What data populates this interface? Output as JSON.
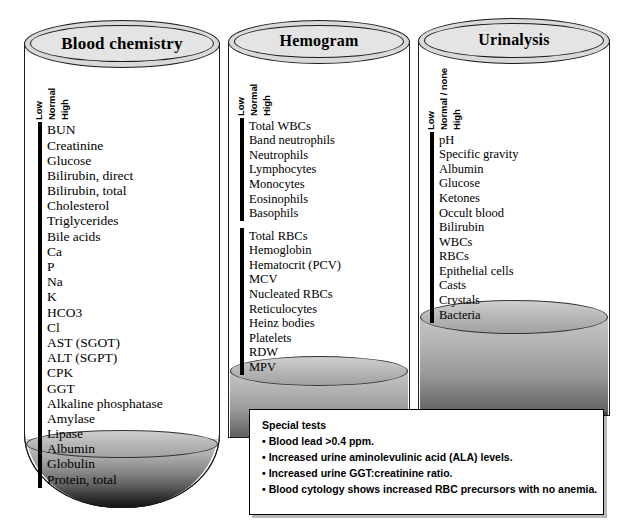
{
  "panels": [
    {
      "id": "blood-chemistry",
      "title": "Blood chemistry",
      "axis": [
        "Low",
        "Normal",
        "High"
      ],
      "groups": [
        {
          "rows": [
            {
              "label": "BUN",
              "status": "normal"
            },
            {
              "label": "Creatinine",
              "status": "normal"
            },
            {
              "label": "Glucose",
              "status": "normal"
            },
            {
              "label": "Bilirubin, direct",
              "status": "normal"
            },
            {
              "label": "Bilirubin, total",
              "status": "normal"
            },
            {
              "label": "Cholesterol",
              "status": "high"
            },
            {
              "label": "Triglycerides",
              "status": "high"
            },
            {
              "label": "Bile acids",
              "status": "normal"
            },
            {
              "label": "Ca",
              "status": "normal"
            },
            {
              "label": "P",
              "status": "normal"
            },
            {
              "label": "Na",
              "status": "normal"
            },
            {
              "label": "K",
              "status": "normal"
            },
            {
              "label": "HCO3",
              "status": "normal"
            },
            {
              "label": "Cl",
              "status": "normal"
            },
            {
              "label": "AST (SGOT)",
              "status": "high"
            },
            {
              "label": "ALT (SGPT)",
              "status": "high"
            },
            {
              "label": "CPK",
              "status": "normal"
            },
            {
              "label": "GGT",
              "status": "normal"
            },
            {
              "label": "Alkaline phosphatase",
              "status": "normal"
            },
            {
              "label": "Amylase",
              "status": "normal"
            },
            {
              "label": "Lipase",
              "status": "normal"
            },
            {
              "label": "Albumin",
              "status": "normal"
            },
            {
              "label": "Globulin",
              "status": "normal"
            },
            {
              "label": "Protein, total",
              "status": "normal"
            }
          ]
        }
      ]
    },
    {
      "id": "hemogram",
      "title": "Hemogram",
      "axis": [
        "Low",
        "Normal",
        "High"
      ],
      "groups": [
        {
          "rows": [
            {
              "label": "Total WBCs",
              "status": "high"
            },
            {
              "label": "Band neutrophils",
              "status": "normal"
            },
            {
              "label": "Neutrophils",
              "status": "high"
            },
            {
              "label": "Lymphocytes",
              "status": "normal"
            },
            {
              "label": "Monocytes",
              "status": "normal"
            },
            {
              "label": "Eosinophils",
              "status": "normal"
            },
            {
              "label": "Basophils",
              "status": "normal"
            }
          ]
        },
        {
          "rows": [
            {
              "label": "Total RBCs",
              "status": "normal"
            },
            {
              "label": "Hemoglobin",
              "status": "normal"
            },
            {
              "label": "Hematocrit (PCV)",
              "status": "normal"
            },
            {
              "label": "MCV",
              "status": "normal"
            },
            {
              "label": "Nucleated RBCs",
              "status": "high"
            },
            {
              "label": "Reticulocytes",
              "status": "high"
            },
            {
              "label": "Heinz bodies",
              "status": "normal"
            },
            {
              "label": "Platelets",
              "status": "normal"
            },
            {
              "label": "RDW",
              "status": "high"
            },
            {
              "label": "MPV",
              "status": "normal"
            }
          ]
        }
      ]
    },
    {
      "id": "urinalysis",
      "title": "Urinalysis",
      "axis": [
        "Low",
        "Normal / none",
        "High"
      ],
      "groups": [
        {
          "rows": [
            {
              "label": "pH",
              "status": "normal"
            },
            {
              "label": "Specific gravity",
              "status": "low"
            },
            {
              "label": "Albumin",
              "status": "high"
            },
            {
              "label": "Glucose",
              "status": "high"
            },
            {
              "label": "Ketones",
              "status": "normal"
            },
            {
              "label": "Occult blood",
              "status": "normal"
            },
            {
              "label": "Bilirubin",
              "status": "normal"
            },
            {
              "label": "WBCs",
              "status": "normal"
            },
            {
              "label": "RBCs",
              "status": "normal"
            },
            {
              "label": "Epithelial cells",
              "status": "normal"
            },
            {
              "label": "Casts",
              "status": "high"
            },
            {
              "label": "Crystals",
              "status": "normal"
            },
            {
              "label": "Bacteria",
              "status": "normal"
            }
          ]
        }
      ]
    }
  ],
  "special_tests": {
    "title": "Special tests",
    "items": [
      "Blood lead >0.4 ppm.",
      "Increased urine aminolevulinic acid (ALA) levels.",
      "Increased urine GGT:creatinine ratio.",
      "Blood cytology shows increased RBC precursors with no anemia."
    ]
  },
  "colors": {
    "normal_fill": "#a8a8a8",
    "high_fill": "#2b2b2b",
    "low_fill": "#d6d6d6",
    "outline": "#000000",
    "rim_fill": "#d9d9d9"
  }
}
